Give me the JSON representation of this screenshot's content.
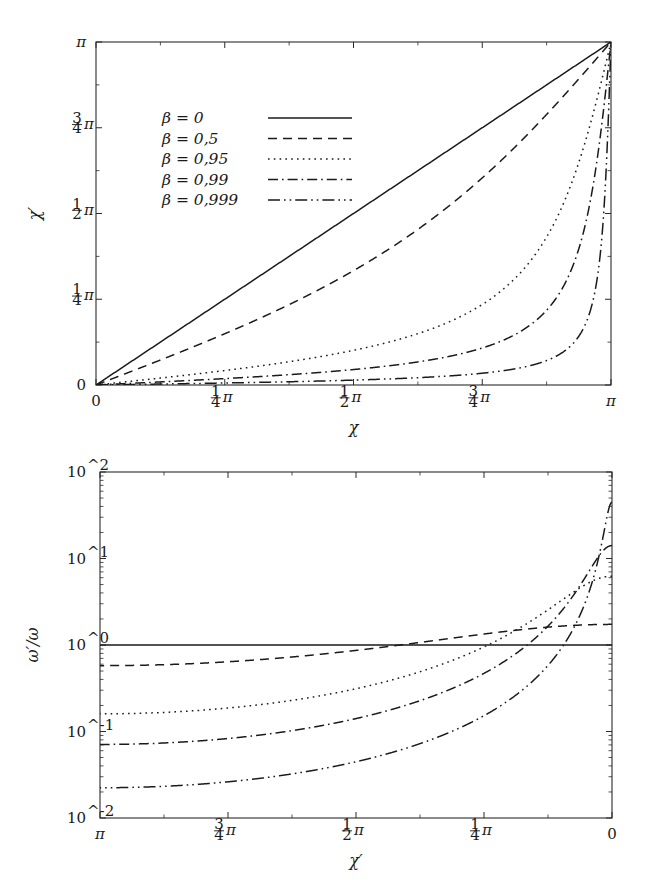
{
  "figure": {
    "background": "#ffffff",
    "ink": "#1a1a1a"
  },
  "legend": {
    "entries": [
      {
        "label": "β = 0",
        "beta": 0,
        "style": "solid"
      },
      {
        "label": "β = 0,5",
        "beta": 0.5,
        "style": "dashed"
      },
      {
        "label": "β = 0,95",
        "beta": 0.95,
        "style": "dotted"
      },
      {
        "label": "β = 0,99",
        "beta": 0.99,
        "style": "dashdot"
      },
      {
        "label": "β = 0,999",
        "beta": 0.999,
        "style": "dashdotdot"
      }
    ]
  },
  "chart_data": [
    {
      "type": "line",
      "id": "aberration",
      "title": "",
      "xlabel": "χ",
      "ylabel": "χ′",
      "xlim": [
        0,
        3.14159265
      ],
      "ylim": [
        0,
        3.14159265
      ],
      "xscale": "linear",
      "yscale": "linear",
      "x_reversed": false,
      "grid": false,
      "legend_position": "upper-left-inside",
      "xticklabels": [
        "0",
        "1/4 π",
        "1/2 π",
        "3/4 π",
        "π"
      ],
      "yticklabels": [
        "0",
        "1/4 π",
        "1/2 π",
        "3/4 π",
        "π"
      ],
      "xtickvalues": [
        0,
        0.78539816,
        1.57079633,
        2.35619449,
        3.14159265
      ],
      "ytickvalues": [
        0,
        0.78539816,
        1.57079633,
        2.35619449,
        3.14159265
      ],
      "formula": "chi_prime = arccos((cos(chi) + beta) / (1 + beta*cos(chi)))",
      "series": [
        {
          "name": "β = 0",
          "beta": 0,
          "style": "solid",
          "x": [
            0.0,
            0.3927,
            0.7854,
            1.1781,
            1.5708,
            1.9635,
            2.3562,
            2.7489,
            3.1416
          ],
          "values": [
            0.0,
            0.3927,
            0.7854,
            1.1781,
            1.5708,
            1.9635,
            2.3562,
            2.7489,
            3.1416
          ]
        },
        {
          "name": "β = 0,5",
          "beta": 0.5,
          "style": "dashed",
          "x": [
            0.0,
            0.3927,
            0.7854,
            1.1781,
            1.5708,
            1.9635,
            2.3562,
            2.7489,
            3.1416
          ],
          "values": [
            0.0,
            0.2254,
            0.491,
            0.8212,
            1.231,
            1.703,
            2.1862,
            2.6604,
            3.1416
          ]
        },
        {
          "name": "β = 0,95",
          "beta": 0.95,
          "style": "dotted",
          "x": [
            0.0,
            0.3927,
            0.7854,
            1.1781,
            1.5708,
            1.9635,
            2.3562,
            2.7489,
            3.1416
          ],
          "values": [
            0.0,
            0.0723,
            0.1618,
            0.2855,
            0.451,
            0.7017,
            1.104,
            1.8038,
            3.1416
          ]
        },
        {
          "name": "β = 0,99",
          "beta": 0.99,
          "style": "dashdot",
          "x": [
            0.0,
            0.3927,
            0.7854,
            1.1781,
            1.5708,
            1.9635,
            2.3562,
            2.7489,
            3.1416
          ],
          "values": [
            0.0,
            0.0322,
            0.0722,
            0.1276,
            0.2003,
            0.3144,
            0.5,
            0.8905,
            3.1416
          ]
        },
        {
          "name": "β = 0,999",
          "beta": 0.999,
          "style": "dashdotdot",
          "x": [
            0.0,
            0.3927,
            0.7854,
            1.1781,
            1.5708,
            1.9635,
            2.3562,
            2.7489,
            3.1416
          ],
          "values": [
            0.0,
            0.0102,
            0.0228,
            0.0403,
            0.0633,
            0.0993,
            0.1585,
            0.2835,
            3.1416
          ]
        }
      ]
    },
    {
      "type": "line",
      "id": "doppler",
      "title": "",
      "xlabel": "χ′",
      "ylabel": "ω′/ω",
      "xlim": [
        3.14159265,
        0
      ],
      "ylim": [
        0.01,
        100
      ],
      "xscale": "linear",
      "yscale": "log",
      "x_reversed": true,
      "grid": false,
      "legend_position": "none",
      "xticklabels": [
        "π",
        "3/4 π",
        "1/2 π",
        "1/4 π",
        "0"
      ],
      "yticklabels": [
        "10^-2",
        "10^-1",
        "10^0",
        "10^1",
        "10^2"
      ],
      "xtickvalues": [
        3.14159265,
        2.35619449,
        1.57079633,
        0.78539816,
        0
      ],
      "ytickvalues": [
        0.01,
        0.1,
        1,
        10,
        100
      ],
      "formula": "omega_ratio = 1 / (gamma * (1 - beta*cos(chi_prime)))",
      "series": [
        {
          "name": "β = 0",
          "beta": 0,
          "style": "solid",
          "x": [
            3.1416,
            2.3562,
            1.5708,
            0.7854,
            0.0
          ],
          "values": [
            1.0,
            1.0,
            1.0,
            1.0,
            1.0
          ]
        },
        {
          "name": "β = 0,5",
          "beta": 0.5,
          "style": "dashed",
          "x": [
            3.1416,
            2.3562,
            1.5708,
            0.7854,
            0.0
          ],
          "values": [
            0.5774,
            0.6766,
            0.866,
            1.2071,
            1.7321
          ]
        },
        {
          "name": "β = 0,95",
          "beta": 0.95,
          "style": "dotted",
          "x": [
            3.1416,
            2.3562,
            1.5708,
            0.7854,
            0.0
          ],
          "values": [
            0.1601,
            0.2089,
            0.3122,
            0.6104,
            6.245
          ]
        },
        {
          "name": "β = 0,99",
          "beta": 0.99,
          "style": "dashdot",
          "x": [
            3.1416,
            2.3562,
            1.5708,
            0.7854,
            0.0
          ],
          "values": [
            0.0709,
            0.0939,
            0.1411,
            0.2832,
            14.1067
          ]
        },
        {
          "name": "β = 0,999",
          "beta": 0.999,
          "style": "dashdotdot",
          "x": [
            3.1416,
            2.3562,
            1.5708,
            0.7854,
            0.0
          ],
          "values": [
            0.0224,
            0.0297,
            0.0447,
            0.0901,
            44.7102
          ]
        }
      ]
    }
  ]
}
